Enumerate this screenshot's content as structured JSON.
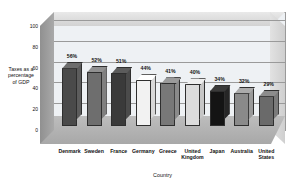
{
  "chart_data": {
    "type": "bar",
    "title": "",
    "xlabel": "Country",
    "ylabel": "Taxes as a percentage of GDP",
    "ylabel_lines": [
      "Taxes as a",
      "percentage",
      "of GDP"
    ],
    "categories": [
      "Denmark",
      "Sweden",
      "France",
      "Germany",
      "Greece",
      "United Kingdom",
      "Japan",
      "Australia",
      "United States"
    ],
    "category_lines": [
      [
        "Denmark"
      ],
      [
        "Sweden"
      ],
      [
        "France"
      ],
      [
        "Germany"
      ],
      [
        "Greece"
      ],
      [
        "United",
        "Kingdom"
      ],
      [
        "Japan"
      ],
      [
        "Australia"
      ],
      [
        "United",
        "States"
      ]
    ],
    "values": [
      56,
      52,
      51,
      44,
      41,
      40,
      34,
      32,
      29
    ],
    "data_labels": [
      "56%",
      "52%",
      "51%",
      "44%",
      "41%",
      "40%",
      "34%",
      "32%",
      "29%"
    ],
    "ylim": [
      0,
      100
    ],
    "yticks": [
      0,
      20,
      40,
      60,
      80,
      100
    ],
    "ytick_labels": [
      "0",
      "20",
      "40",
      "60",
      "80",
      "100"
    ],
    "grid": true,
    "legend": "none",
    "bar_colors": [
      "#4a4a4a",
      "#6e6e6e",
      "#3a3a3a",
      "#f2f2f2",
      "#787878",
      "#dcdcdc",
      "#141414",
      "#8a8a8a",
      "#6a6a6a"
    ],
    "bar_top_colors": [
      "#6d6d6d",
      "#909090",
      "#5c5c5c",
      "#ffffff",
      "#9b9b9b",
      "#efefef",
      "#3a3a3a",
      "#ababab",
      "#8c8c8c"
    ],
    "bar_side_colors": [
      "#5c5c5c",
      "#7f7f7f",
      "#4b4b4b",
      "#d8d8d8",
      "#8a8a8a",
      "#c6c6c6",
      "#262626",
      "#9a9a9a",
      "#7b7b7b"
    ],
    "plot_background": "#eef1f4",
    "floor_color": "#b4b4b4",
    "wall_color": "#9c9c9c",
    "gridline_color": "#9a9a9a"
  }
}
